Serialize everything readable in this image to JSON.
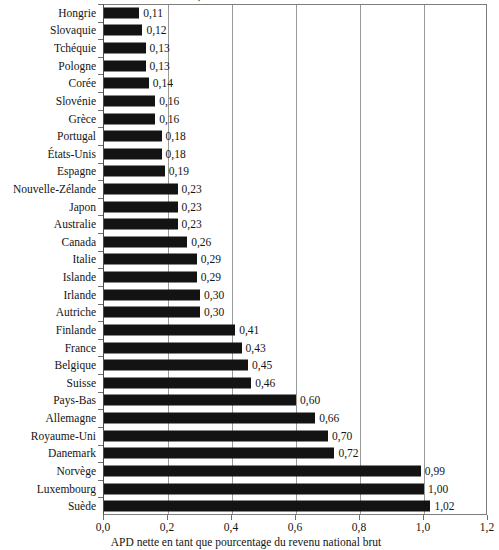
{
  "chart_data": {
    "type": "bar",
    "orientation": "horizontal",
    "title": "Générosité relative des donneurs du CAD, 2013",
    "xlabel": "APD nette en tant que pourcentage du revenu national brut",
    "ylabel": "",
    "xlim": [
      0.0,
      1.2
    ],
    "xticks": [
      0.0,
      0.2,
      0.4,
      0.6,
      0.8,
      1.0,
      1.2
    ],
    "xtick_labels": [
      "0,0",
      "0,2",
      "0,4",
      "0,6",
      "0,8",
      "1,0",
      "1,2"
    ],
    "grid": "vertical",
    "legend": "none",
    "decimal_separator": ",",
    "bar_color": "#131313",
    "categories": [
      "Hongrie",
      "Slovaquie",
      "Tchéquie",
      "Pologne",
      "Corée",
      "Slovénie",
      "Grèce",
      "Portugal",
      "États-Unis",
      "Espagne",
      "Nouvelle-Zélande",
      "Japon",
      "Australie",
      "Canada",
      "Italie",
      "Islande",
      "Irlande",
      "Autriche",
      "Finlande",
      "France",
      "Belgique",
      "Suisse",
      "Pays-Bas",
      "Allemagne",
      "Royaume-Uni",
      "Danemark",
      "Norvège",
      "Luxembourg",
      "Suède"
    ],
    "values": [
      0.11,
      0.12,
      0.13,
      0.13,
      0.14,
      0.16,
      0.16,
      0.18,
      0.18,
      0.19,
      0.23,
      0.23,
      0.23,
      0.26,
      0.29,
      0.29,
      0.3,
      0.3,
      0.41,
      0.43,
      0.45,
      0.46,
      0.6,
      0.66,
      0.7,
      0.72,
      0.99,
      1.0,
      1.02
    ],
    "data_labels": [
      "0,11",
      "0,12",
      "0,13",
      "0,13",
      "0,14",
      "0,16",
      "0,16",
      "0,18",
      "0,18",
      "0,19",
      "0,23",
      "0,23",
      "0,23",
      "0,26",
      "0,29",
      "0,29",
      "0,30",
      "0,30",
      "0,41",
      "0,43",
      "0,45",
      "0,46",
      "0,60",
      "0,66",
      "0,70",
      "0,72",
      "0,99",
      "1,00",
      "1,02"
    ]
  }
}
